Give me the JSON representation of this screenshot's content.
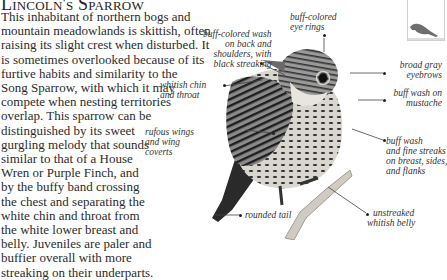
{
  "title": "Lincoln's Sparrow",
  "body_lines": [
    "This inhabitant of northern bogs and",
    "mountain meadowlands is skittish, often",
    "raising its slight crest when disturbed. It",
    "is sometimes overlooked because of its",
    "furtive habits and similarity to the",
    "Song Sparrow, with which it may",
    "compete when nesting territories",
    "overlap. This sparrow can be",
    "distinguished by its sweet",
    "gurgling melody that sounds",
    "similar to that of a House",
    "Wren or Purple Finch, and",
    "by the buffy band crossing",
    "the chest and separating the",
    "white chin and throat from",
    "the white lower breast and",
    "belly. Juveniles are paler and",
    "buffier overall with more",
    "streaking on their underparts."
  ],
  "labels": {
    "back": [
      "buff-colored wash",
      "on back and",
      "shoulders, with",
      "black streaking"
    ],
    "eye_rings": [
      "buff-colored",
      "eye rings"
    ],
    "eyebrows": [
      "broad gray",
      "eyebrows"
    ],
    "mustache": [
      "buff wash on",
      "mustache"
    ],
    "chin": [
      "whitish chin",
      "and throat"
    ],
    "wings": [
      "rufous wings",
      "and wing",
      "coverts"
    ],
    "breast": [
      "buff wash",
      "and fine streaks",
      "on breast, sides,",
      "and flanks"
    ],
    "tail": [
      "rounded tail"
    ],
    "belly": [
      "unstreaked",
      "whitish belly"
    ]
  },
  "thumbnail": {
    "icon": "bird-silhouette-icon",
    "color": "#6e6e6e"
  },
  "colors": {
    "text": "#2b2b2b",
    "leader": "#444444",
    "background": "#ffffff"
  }
}
